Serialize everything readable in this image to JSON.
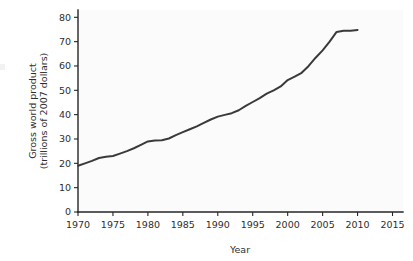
{
  "chart_data": {
    "type": "line",
    "title": "",
    "xlabel": "Year",
    "ylabel": "Gross world product (trillions of 2007 dollars)",
    "ylabel_line1": "Gross world product",
    "ylabel_line2": "(trillions of 2007 dollars)",
    "xlim": [
      1970,
      2016.5
    ],
    "ylim": [
      0,
      83
    ],
    "xticks": [
      1970,
      1975,
      1980,
      1985,
      1990,
      1995,
      2000,
      2005,
      2010,
      2015
    ],
    "xtick_labels": [
      "1970",
      "1975",
      "1980",
      "1985",
      "1990",
      "1995",
      "2000",
      "2005",
      "2010",
      "2015"
    ],
    "yticks": [
      0,
      10,
      20,
      30,
      40,
      50,
      60,
      70,
      80
    ],
    "ytick_labels": [
      "0",
      "10",
      "20",
      "30",
      "40",
      "50",
      "60",
      "70",
      "80"
    ],
    "grid": false,
    "legend": null,
    "series": [
      {
        "name": "Gross world product",
        "color": "#3a3a3a",
        "line_width": 2.0,
        "x": [
          1970,
          1971,
          1972,
          1973,
          1974,
          1975,
          1976,
          1977,
          1978,
          1979,
          1980,
          1981,
          1982,
          1983,
          1984,
          1985,
          1986,
          1987,
          1988,
          1989,
          1990,
          1991,
          1992,
          1993,
          1994,
          1995,
          1996,
          1997,
          1998,
          1999,
          2000,
          2001,
          2002,
          2003,
          2004,
          2005,
          2006,
          2007,
          2008,
          2009,
          2010
        ],
        "values": [
          19.0,
          20.0,
          21.0,
          22.2,
          22.7,
          23.0,
          24.0,
          25.0,
          26.2,
          27.6,
          29.0,
          29.4,
          29.5,
          30.2,
          31.6,
          32.8,
          34.0,
          35.2,
          36.6,
          38.0,
          39.2,
          39.9,
          40.6,
          41.8,
          43.6,
          45.2,
          46.8,
          48.6,
          50.0,
          51.6,
          54.2,
          55.6,
          57.2,
          60.0,
          63.4,
          66.4,
          70.0,
          74.0,
          74.5,
          74.5,
          74.8
        ]
      }
    ]
  },
  "axis": {
    "x_label": "Year",
    "y_label_line1": "Gross world product",
    "y_label_line2": "(trillions of 2007 dollars)"
  },
  "colors": {
    "line": "#3a3a3a",
    "axis": "#262626",
    "text": "#2e2e2e",
    "plot_background": "#fbfbfb",
    "page_background": "#ffffff"
  }
}
